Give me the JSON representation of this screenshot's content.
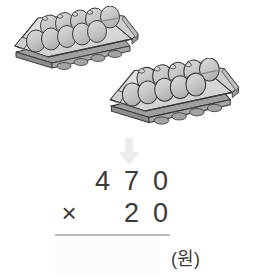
{
  "illustration": {
    "alt": "two-egg-cartons",
    "carton_count": 2,
    "eggs_per_carton": 10,
    "egg_rows": 2,
    "egg_columns": 5,
    "tray_fill": "#dcdcdc",
    "egg_fill": "#c4c4c4",
    "outline_color": "#3b3b3b",
    "cartons": [
      {
        "name": "carton-top-left"
      },
      {
        "name": "carton-bottom-right"
      }
    ]
  },
  "arrow": {
    "icon": "arrow-down-icon",
    "direction": "down",
    "color": "#ececec"
  },
  "equation": {
    "type": "long-multiplication",
    "multiplicand": "470",
    "multiplicand_digits": [
      "4",
      "7",
      "0"
    ],
    "multiplier": "20",
    "multiplier_digits": [
      "2",
      "0"
    ],
    "operator": "×",
    "answer": "",
    "answer_placeholder": "",
    "unit_label": "(원)",
    "rule_color": "#b9b9b9",
    "digit_color": "#3a3a3a"
  }
}
